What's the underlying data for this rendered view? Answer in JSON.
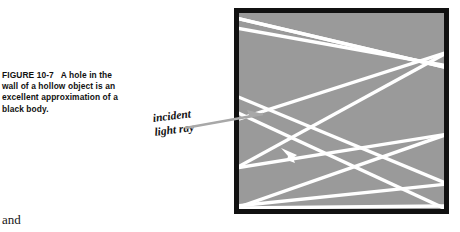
{
  "figure": {
    "number": "FIGURE 10-7",
    "caption_lines": [
      "A hole in the",
      "wall of a hollow object is an",
      "excellent approximation of a",
      "black body."
    ],
    "caption_line1_rest": "A hole in the",
    "caption_line2": "wall of a hollow object is an",
    "caption_line3": "excellent approximation of a",
    "caption_line4": "black body."
  },
  "annotations": {
    "incident_label_line1": "incident",
    "incident_label_line2": "light ray",
    "incident_arrow_name": "incident-ray-arrow",
    "internal_arrow_name": "reflected-ray-arrow"
  },
  "body": {
    "trailing_word": "and"
  },
  "colors": {
    "cavity_fill": "#9a9a9a",
    "cavity_border": "#111111",
    "ray_stroke": "#ffffff",
    "incident_arrow": "#a6a6a6",
    "text": "#111111",
    "page_background": "#ffffff"
  },
  "geometry": {
    "box_left": 234,
    "box_top": 8,
    "box_width": 215,
    "box_height": 206,
    "border_width": 5,
    "ray_width": 3.2,
    "hole_entry_y": 120
  }
}
